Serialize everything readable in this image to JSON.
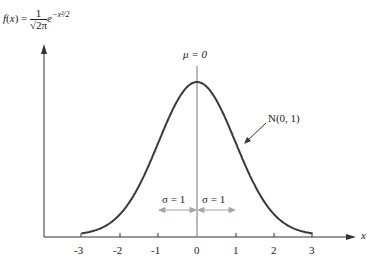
{
  "chart_data": {
    "type": "line",
    "formula": {
      "lhs": "f(x) =",
      "num": "1",
      "den": "√2π",
      "exp_base": "e",
      "exp": "−x²/2"
    },
    "xlabel": "x",
    "ylabel": "f(x)",
    "xlim": [
      -3,
      3
    ],
    "x_ticks": [
      "-3",
      "-2",
      "-1",
      "0",
      "1",
      "2",
      "3"
    ],
    "series": [
      {
        "name": "N(0, 1)",
        "mean": 0,
        "std": 1,
        "peak": 0.3989
      }
    ],
    "annotations": {
      "mean_label": "μ = 0",
      "curve_label": "N(0, 1)",
      "sigma_left": "σ = 1",
      "sigma_right": "σ = 1"
    },
    "colors": {
      "curve": "#333333",
      "axis": "#333333",
      "sigma_arrow": "#9aa8b0"
    }
  }
}
